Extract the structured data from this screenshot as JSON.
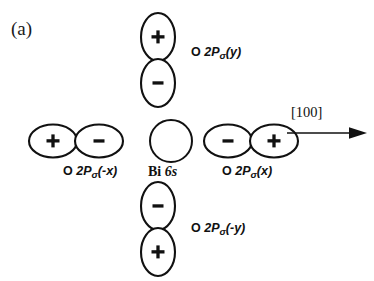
{
  "figure": {
    "panel_label": "(a)",
    "background_color": "#ffffff",
    "ink_color": "#111111"
  },
  "center": {
    "name": "bi-6s",
    "symbol": "Bi",
    "shell": "6s",
    "shape": "circle",
    "sign": ""
  },
  "direction": {
    "label": "[100]",
    "arrow": "right-arrow-icon"
  },
  "orbitals": {
    "top": {
      "position": "top",
      "element": "O",
      "term": "2P",
      "sigma": "σ",
      "axis": "(y)",
      "orientation": "vertical",
      "near_lobe_sign": "−",
      "far_lobe_sign": "+",
      "upper_sign": "+",
      "lower_sign": "−"
    },
    "bottom": {
      "position": "bottom",
      "element": "O",
      "term": "2P",
      "sigma": "σ",
      "axis": "(-y)",
      "orientation": "vertical",
      "near_lobe_sign": "−",
      "far_lobe_sign": "+",
      "upper_sign": "−",
      "lower_sign": "+"
    },
    "left": {
      "position": "left",
      "element": "O",
      "term": "2P",
      "sigma": "σ",
      "axis": "(-x)",
      "orientation": "horizontal",
      "near_lobe_sign": "−",
      "far_lobe_sign": "+",
      "left_sign": "+",
      "right_sign": "−"
    },
    "right": {
      "position": "right",
      "element": "O",
      "term": "2P",
      "sigma": "σ",
      "axis": "(x)",
      "orientation": "horizontal",
      "near_lobe_sign": "−",
      "far_lobe_sign": "+",
      "left_sign": "−",
      "right_sign": "+"
    }
  }
}
